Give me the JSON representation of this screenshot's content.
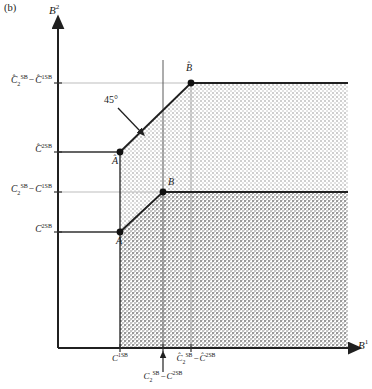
{
  "figure": {
    "panel_tag": "(b)",
    "axis_y_label": "B²",
    "axis_x_label": "B¹",
    "angle_annotation": "45°"
  },
  "points": [
    {
      "id": "A",
      "label": "A",
      "hat": false,
      "x_px": 120,
      "y_px": 232
    },
    {
      "id": "A_hat",
      "label": "Â",
      "hat": true,
      "x_px": 120,
      "y_px": 152
    },
    {
      "id": "B",
      "label": "B",
      "hat": false,
      "x_px": 163,
      "y_px": 192
    },
    {
      "id": "B_hat",
      "label": "B̂",
      "hat": true,
      "x_px": 191,
      "y_px": 83
    }
  ],
  "y_axis": {
    "ticks": [
      {
        "id": "y-tick-chat2sb-minus-chat1sb",
        "y_px": 83,
        "base": "C",
        "hat": true,
        "sub": "2",
        "sup": "SB",
        "second_base": "C",
        "second_hat": true,
        "second_sub": "",
        "second_sup": "1SB",
        "has_minus": true
      },
      {
        "id": "y-tick-chat2sb",
        "y_px": 152,
        "base": "C",
        "hat": true,
        "sub": "",
        "sup": "2SB",
        "second_base": "",
        "second_hat": false,
        "second_sub": "",
        "second_sup": "",
        "has_minus": false
      },
      {
        "id": "y-tick-c2sb-minus-c1sb",
        "y_px": 192,
        "base": "C",
        "hat": false,
        "sub": "2",
        "sup": "SB",
        "second_base": "C",
        "second_hat": false,
        "second_sub": "",
        "second_sup": "1SB",
        "has_minus": true
      },
      {
        "id": "y-tick-c2sb",
        "y_px": 232,
        "base": "C",
        "hat": false,
        "sub": "",
        "sup": "2SB",
        "second_base": "",
        "second_hat": false,
        "second_sub": "",
        "second_sup": "",
        "has_minus": false
      }
    ]
  },
  "x_axis": {
    "ticks": [
      {
        "id": "x-tick-c1sb",
        "x_px": 120,
        "base": "C",
        "hat": false,
        "sub": "",
        "sup": "1SB",
        "second_base": "",
        "second_hat": false,
        "second_sup": "",
        "has_minus": false
      },
      {
        "id": "x-tick-c2sb-minus-c2sb",
        "x_px": 163,
        "base": "C",
        "hat": false,
        "sub": "2",
        "sup": "SB",
        "second_base": "C",
        "second_hat": false,
        "second_sup": "2SB",
        "has_minus": true
      },
      {
        "id": "x-tick-chat2sb-minus-chat2sb",
        "x_px": 191,
        "base": "C",
        "hat": true,
        "sub": "2",
        "sup": "SB",
        "second_base": "C",
        "second_hat": true,
        "second_sup": "2SB",
        "has_minus": true
      }
    ]
  },
  "colors": {
    "ink": "#1a1a1a",
    "axis": "#202020",
    "grid_light": "#b8b8b8",
    "grid_dark": "#404040",
    "fill_light": "#d9d9d9",
    "fill_dark": "#b0b0b0",
    "frontier": "#202020",
    "background": "#ffffff"
  },
  "geometry": {
    "origin_x_px": 58,
    "origin_y_px": 348,
    "right_edge_px": 348,
    "y_arrow_tip_px": 25,
    "x_arrow_tip_px": 355
  }
}
